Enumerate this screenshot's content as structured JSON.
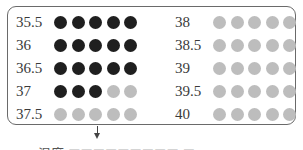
{
  "diagram": {
    "colors": {
      "filled": "#1f1f1f",
      "empty": "#bdbdbd",
      "border": "#6a6a6a"
    },
    "left_column": [
      {
        "label": "35.5",
        "filled": 5,
        "total": 5
      },
      {
        "label": "36",
        "filled": 5,
        "total": 5
      },
      {
        "label": "36.5",
        "filled": 5,
        "total": 5
      },
      {
        "label": "37",
        "filled": 3,
        "total": 5
      },
      {
        "label": "37.5",
        "filled": 0,
        "total": 5
      }
    ],
    "right_column": [
      {
        "label": "38",
        "filled": 0,
        "total": 5
      },
      {
        "label": "38.5",
        "filled": 0,
        "total": 5
      },
      {
        "label": "39",
        "filled": 0,
        "total": 5
      },
      {
        "label": "39.5",
        "filled": 0,
        "total": 5
      },
      {
        "label": "40",
        "filled": 0,
        "total": 5
      }
    ],
    "caption": "温度  ■■■■■■■■■   ■"
  }
}
